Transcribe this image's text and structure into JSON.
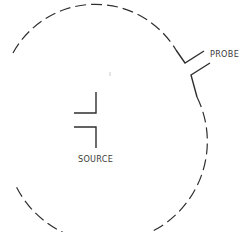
{
  "diagram": {
    "labels": {
      "probe": "PROBE",
      "source": "SOURCE"
    },
    "colors": {
      "stroke": "#2f2f2f",
      "background": "#ffffff"
    }
  }
}
